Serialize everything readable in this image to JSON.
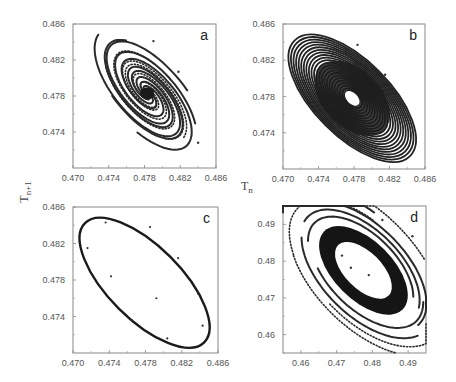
{
  "chart_data": [
    {
      "panel": "a",
      "type": "scatter",
      "description": "Phase portrait: trajectories spiralling inward to a stable fixed point",
      "xlabel": "T_n",
      "ylabel": "T_n+1",
      "xlim": [
        0.47,
        0.486
      ],
      "ylim": [
        0.47,
        0.486
      ],
      "xticks": [
        "0.470",
        "0.474",
        "0.478",
        "0.482",
        "0.486"
      ],
      "yticks": [
        "0.474",
        "0.478",
        "0.482",
        "0.486"
      ],
      "fixed_point": [
        0.4783,
        0.4783
      ],
      "isolated_points": [
        [
          0.479,
          0.4841
        ],
        [
          0.4818,
          0.4807
        ],
        [
          0.484,
          0.4728
        ]
      ],
      "spiral": {
        "turns": 1.6,
        "arms": 10,
        "r_max": 0.0085,
        "tilt_deg": -50,
        "aspect": 0.45
      }
    },
    {
      "panel": "b",
      "type": "scatter",
      "description": "Trajectories spiralling outward from an unstable point, dense elliptical band",
      "xlim": [
        0.47,
        0.486
      ],
      "ylim": [
        0.47,
        0.486
      ],
      "xticks": [
        "0.470",
        "0.474",
        "0.478",
        "0.482",
        "0.486"
      ],
      "yticks": [
        "0.474",
        "0.478",
        "0.482",
        "0.486"
      ],
      "center": [
        0.4778,
        0.4778
      ],
      "hole_radius": [
        0.001,
        0.0006
      ],
      "outer_radius": [
        0.0092,
        0.0042
      ],
      "tilt_deg": -45,
      "isolated_points": [
        [
          0.4784,
          0.4837
        ],
        [
          0.4815,
          0.4804
        ],
        [
          0.4836,
          0.4767
        ]
      ]
    },
    {
      "panel": "c",
      "type": "line",
      "description": "Closed elliptical limit cycle with scattered sample points",
      "xlim": [
        0.47,
        0.486
      ],
      "ylim": [
        0.47,
        0.486
      ],
      "xticks": [
        "0.470",
        "0.474",
        "0.478",
        "0.482",
        "0.486"
      ],
      "yticks": [
        "0.474",
        "0.478",
        "0.482",
        "0.486"
      ],
      "ellipse": {
        "center": [
          0.4779,
          0.4777
        ],
        "rx": 0.0093,
        "ry": 0.004,
        "tilt_deg": -45
      },
      "points": [
        [
          0.4716,
          0.4815
        ],
        [
          0.4736,
          0.4843
        ],
        [
          0.4742,
          0.4784
        ],
        [
          0.4765,
          0.4736
        ],
        [
          0.4785,
          0.4838
        ],
        [
          0.4792,
          0.476
        ],
        [
          0.4804,
          0.4716
        ],
        [
          0.4816,
          0.4804
        ],
        [
          0.4838,
          0.4765
        ],
        [
          0.4843,
          0.473
        ]
      ]
    },
    {
      "panel": "d",
      "type": "scatter",
      "description": "Trajectories converging onto a thick elliptical attractor from outside and inside",
      "xlim": [
        0.455,
        0.495
      ],
      "ylim": [
        0.455,
        0.495
      ],
      "xticks": [
        "0.46",
        "0.47",
        "0.48",
        "0.49"
      ],
      "yticks": [
        "0.46",
        "0.47",
        "0.48",
        "0.49"
      ],
      "center": [
        0.4775,
        0.4775
      ],
      "inner_radius": [
        0.01,
        0.005
      ],
      "band_radius": [
        0.0155,
        0.008
      ],
      "tilt_deg": -45,
      "isolated_points": [
        [
          0.4828,
          0.4912
        ],
        [
          0.4912,
          0.4868
        ],
        [
          0.4715,
          0.4815
        ],
        [
          0.474,
          0.4782
        ],
        [
          0.479,
          0.4762
        ]
      ]
    }
  ],
  "figure": {
    "panel_letters": [
      "a",
      "b",
      "c",
      "d"
    ],
    "shared_ylabel_main": "T",
    "shared_ylabel_sub": "n+1",
    "shared_xlabel_main": "T",
    "shared_xlabel_sub": "n"
  }
}
